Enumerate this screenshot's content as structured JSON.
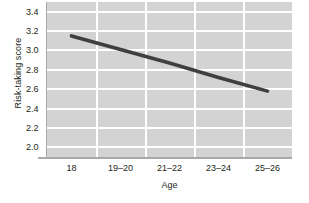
{
  "chart_data": {
    "type": "line",
    "title": "",
    "xlabel": "Age",
    "ylabel": "Risk-taking score",
    "categories": [
      "18",
      "19–20",
      "21–22",
      "23–24",
      "25–26"
    ],
    "series": [
      {
        "name": "Risk-taking score",
        "values": [
          3.15,
          3.01,
          2.87,
          2.72,
          2.58
        ],
        "color": "#3f3f3f"
      }
    ],
    "yticks": [
      "2.0",
      "2.2",
      "2.4",
      "2.6",
      "2.8",
      "3.0",
      "3.2",
      "3.4"
    ],
    "ytick_values": [
      2.0,
      2.2,
      2.4,
      2.6,
      2.8,
      3.0,
      3.2,
      3.4
    ],
    "ylim": [
      1.9,
      3.5
    ],
    "grid": "both",
    "legend": "none",
    "plot_background": "#d3d3d3",
    "gridline_color": "#ffffff",
    "axis_color": "#a7a9ac",
    "text_color": "#231f20"
  }
}
